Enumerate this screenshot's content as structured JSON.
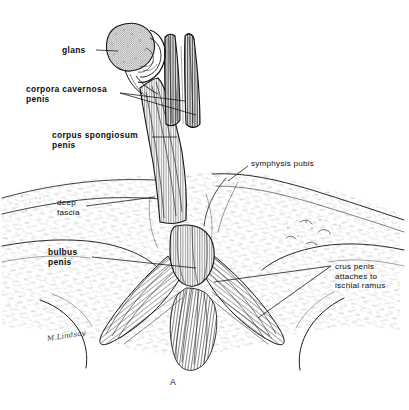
{
  "figure": {
    "kind": "anatomical-line-drawing",
    "panel_letter": "A",
    "artist_signature": "M.Lindsay",
    "background_color": "#ffffff",
    "ink_color": "#1a1a1a"
  },
  "labels": [
    {
      "id": "glans",
      "text": "glans",
      "weight": "bold",
      "x": 62,
      "y": 46,
      "align": "left"
    },
    {
      "id": "corpora-cavernosa",
      "text": "corpora cavernosa\npenis",
      "weight": "bold",
      "x": 26,
      "y": 85,
      "align": "left"
    },
    {
      "id": "corpus-spongiosum",
      "text": "corpus spongiosum\npenis",
      "weight": "bold",
      "x": 52,
      "y": 131,
      "align": "left"
    },
    {
      "id": "deep-fascia",
      "text": "deep\nfascia",
      "weight": "light",
      "x": 57,
      "y": 198,
      "align": "left"
    },
    {
      "id": "bulbus-penis",
      "text": "bulbus\npenis",
      "weight": "bold",
      "x": 48,
      "y": 248,
      "align": "left"
    },
    {
      "id": "symphysis-pubis",
      "text": "symphysis pubis",
      "weight": "light",
      "x": 251,
      "y": 159,
      "align": "left"
    },
    {
      "id": "crus-penis",
      "text": "crus penis\nattaches to\nischial ramus",
      "weight": "light",
      "x": 335,
      "y": 262,
      "align": "left"
    }
  ],
  "leaders": [
    {
      "id": "leader-glans",
      "points": "96,50 118,51"
    },
    {
      "id": "leader-cc-upper",
      "points": "120,93 185,101"
    },
    {
      "id": "leader-cc-lower",
      "points": "120,93 196,115"
    },
    {
      "id": "leader-cs",
      "points": "152,137 177,137"
    },
    {
      "id": "leader-deep-fascia",
      "points": "86,206 155,197"
    },
    {
      "id": "leader-bulbus",
      "points": "92,257 196,268"
    },
    {
      "id": "leader-symphysis",
      "points": "248,166 228,181"
    },
    {
      "id": "leader-crus-upper",
      "points": "331,266 214,282"
    },
    {
      "id": "leader-crus-lower",
      "points": "331,266 258,318"
    }
  ],
  "panel": {
    "letter": "A",
    "x": 170,
    "y": 377
  },
  "signature": {
    "text": "M.Lindsay",
    "x": 47,
    "y": 332
  }
}
